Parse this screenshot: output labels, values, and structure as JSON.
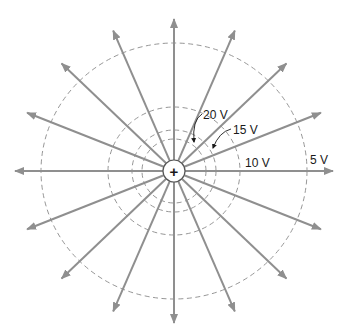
{
  "diagram": {
    "charge": {
      "symbol": "+",
      "label": "positive-charge"
    },
    "center": {
      "x": 174,
      "y": 171
    },
    "charge_radius": 11,
    "field_line_count": 16,
    "field_line_angle_step_deg": 22.5,
    "field_line_reach": {
      "rx": 159,
      "ry": 152
    },
    "colors": {
      "field_line": "#8f8f8f",
      "equipotential": "#8a8a8a",
      "text": "#1a1a1a",
      "background": "#ffffff"
    },
    "equipotentials": [
      {
        "label": "20 V",
        "rx": 32,
        "ry": 32
      },
      {
        "label": "15 V",
        "rx": 42,
        "ry": 41
      },
      {
        "label": "10 V",
        "rx": 66,
        "ry": 64
      },
      {
        "label": "5 V",
        "rx": 133,
        "ry": 128
      }
    ],
    "labels": {
      "v20": "20 V",
      "v15": "15 V",
      "v10": "10 V",
      "v5": "5 V"
    }
  }
}
